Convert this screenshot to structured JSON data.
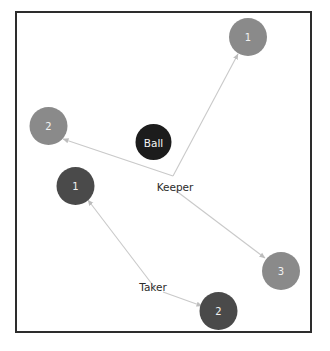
{
  "canvas": {
    "width": 330,
    "height": 351,
    "background": "#ffffff"
  },
  "frame": {
    "name": "pitch-frame",
    "x": 15,
    "y": 11,
    "width": 297,
    "height": 322,
    "stroke": "#2d2d2d",
    "stroke_width": 2,
    "fill": "#ffffff"
  },
  "colors": {
    "light_player": "#8a8a8a",
    "dark_player": "#4a4a4a",
    "ball": "#1c1c1c",
    "edge": "#c9c9c9",
    "frame": "#2d2d2d",
    "role_text": "#2b2b2b",
    "node_text": "#f2f2f2"
  },
  "roles": [
    {
      "id": "keeper",
      "label": "Keeper",
      "x": 173,
      "y": 176,
      "label_x": 175,
      "label_y": 187
    },
    {
      "id": "taker",
      "label": "Taker",
      "x": 155,
      "y": 288,
      "label_x": 153,
      "label_y": 287
    }
  ],
  "ball": {
    "id": "ball",
    "label": "Ball",
    "x": 153.5,
    "y": 142,
    "r": 18,
    "color": "#1c1c1c"
  },
  "players": [
    {
      "id": "keeper-target-1",
      "label": "1",
      "x": 248,
      "y": 37,
      "r": 19,
      "color": "#8a8a8a",
      "group": "light"
    },
    {
      "id": "keeper-target-2",
      "label": "2",
      "x": 48.5,
      "y": 126,
      "r": 19,
      "color": "#8a8a8a",
      "group": "light"
    },
    {
      "id": "keeper-target-3",
      "label": "3",
      "x": 281,
      "y": 271,
      "r": 19,
      "color": "#8a8a8a",
      "group": "light"
    },
    {
      "id": "taker-target-1",
      "label": "1",
      "x": 75.5,
      "y": 186,
      "r": 19,
      "color": "#4a4a4a",
      "group": "dark"
    },
    {
      "id": "taker-target-2",
      "label": "2",
      "x": 218.5,
      "y": 311,
      "r": 19,
      "color": "#4a4a4a",
      "group": "dark"
    }
  ],
  "edges": [
    {
      "id": "keeper-to-1",
      "from": "keeper",
      "to": "keeper-target-1",
      "x1": 173,
      "y1": 176,
      "x2": 238,
      "y2": 54
    },
    {
      "id": "keeper-to-2",
      "from": "keeper",
      "to": "keeper-target-2",
      "x1": 173,
      "y1": 176,
      "x2": 63,
      "y2": 139
    },
    {
      "id": "keeper-to-3",
      "from": "keeper",
      "to": "keeper-target-3",
      "x1": 175,
      "y1": 190,
      "x2": 265,
      "y2": 258
    },
    {
      "id": "taker-to-1",
      "from": "taker",
      "to": "taker-target-1",
      "x1": 155,
      "y1": 288,
      "x2": 88,
      "y2": 200
    },
    {
      "id": "taker-to-2",
      "from": "taker",
      "to": "taker-target-2",
      "x1": 163,
      "y1": 292,
      "x2": 202,
      "y2": 306
    }
  ]
}
